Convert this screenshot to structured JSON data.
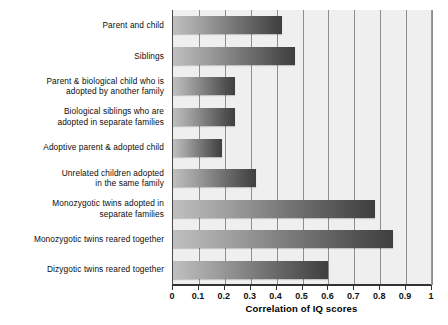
{
  "chart_data": {
    "type": "bar",
    "orientation": "horizontal",
    "title": "",
    "xlabel": "Correlation of IQ scores",
    "ylabel": "",
    "xlim": [
      0,
      1
    ],
    "xticks": [
      "0",
      "0.1",
      "0.2",
      "0.3",
      "0.4",
      "0.5",
      "0.6",
      "0.7",
      "0.8",
      "0.9",
      "1"
    ],
    "grid": "vertical",
    "legend": "none",
    "categories": [
      "Parent and child",
      "Siblings",
      "Parent & biological child who is adopted by another family",
      "Biological siblings who are adopted in separate families",
      "Adoptive parent & adopted child",
      "Unrelated children adopted in the same family",
      "Monozygotic twins adopted in separate families",
      "Monozygotic twins reared together",
      "Dizygotic twins reared together"
    ],
    "category_lines": [
      [
        "Parent and child"
      ],
      [
        "Siblings"
      ],
      [
        "Parent & biological child who is",
        "adopted by another family"
      ],
      [
        "Biological siblings who are",
        "adopted in separate families"
      ],
      [
        "Adoptive parent & adopted child"
      ],
      [
        "Unrelated children adopted",
        "in the same family"
      ],
      [
        "Monozygotic twins adopted in",
        "separate families"
      ],
      [
        "Monozygotic twins reared together"
      ],
      [
        "Dizygotic twins reared together"
      ]
    ],
    "values": [
      0.42,
      0.47,
      0.24,
      0.24,
      0.19,
      0.32,
      0.78,
      0.85,
      0.6
    ],
    "bar_colors": {
      "gradient_start": "#bfbfbf",
      "gradient_end": "#3f3f3f"
    },
    "plot_background": "#efefef",
    "gridline_color": "#8e8e8e"
  },
  "axis": {
    "x_title": "Correlation of IQ scores"
  }
}
